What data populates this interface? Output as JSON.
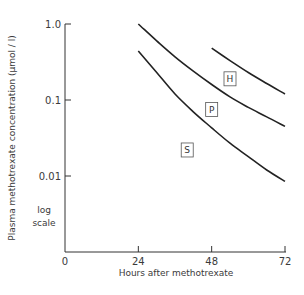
{
  "chart_data": {
    "type": "line",
    "title": "",
    "xlabel": "Hours after methotrexate",
    "ylabel": "Plasma methotrexate concentration (μmol / l)",
    "y_scale": "log",
    "y_scale_note": [
      "log",
      "scale"
    ],
    "xlim": [
      0,
      72
    ],
    "ylim": [
      0.005,
      1.0
    ],
    "x_ticks": [
      0,
      24,
      48,
      72
    ],
    "x_tick_labels": [
      "0",
      "24",
      "48",
      "72"
    ],
    "y_ticks": [
      1.0,
      0.1,
      0.01
    ],
    "y_tick_labels": [
      "1.0",
      "0.1",
      "0.01"
    ],
    "grid": false,
    "series": [
      {
        "name": "H",
        "x": [
          48,
          54,
          60,
          66,
          72
        ],
        "values": [
          0.48,
          0.33,
          0.23,
          0.165,
          0.12
        ],
        "label_at": [
          54,
          0.19
        ]
      },
      {
        "name": "P",
        "x": [
          24,
          30,
          36,
          42,
          48,
          54,
          60,
          66,
          72
        ],
        "values": [
          1.0,
          0.6,
          0.37,
          0.24,
          0.16,
          0.11,
          0.08,
          0.06,
          0.045
        ],
        "label_at": [
          48,
          0.075
        ]
      },
      {
        "name": "S",
        "x": [
          24,
          30,
          36,
          42,
          48,
          54,
          60,
          66,
          72
        ],
        "values": [
          0.44,
          0.23,
          0.12,
          0.07,
          0.043,
          0.027,
          0.018,
          0.012,
          0.0085
        ],
        "label_at": [
          40,
          0.022
        ]
      }
    ]
  }
}
